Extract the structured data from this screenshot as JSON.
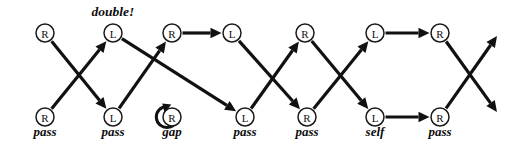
{
  "diagram": {
    "type": "comparison-network",
    "width": 520,
    "height": 142,
    "colors": {
      "stroke": "#111111",
      "node_fill": "#ffffff",
      "node_stroke": "#1a1a1a",
      "text": "#0d0d0d",
      "background": "#ffffff"
    },
    "geometry": {
      "node_radius": 9,
      "top_row_y": 33,
      "bottom_row_y": 117,
      "caption_y": 136,
      "edge_stroke_width": 3.2
    },
    "nodes": [
      {
        "id": "t1",
        "letter": "R",
        "x": 45,
        "y": 33,
        "row": "top",
        "caption": ""
      },
      {
        "id": "t2",
        "letter": "L",
        "x": 113,
        "y": 33,
        "row": "top",
        "caption": ""
      },
      {
        "id": "t3",
        "letter": "R",
        "x": 172,
        "y": 33,
        "row": "top",
        "caption": ""
      },
      {
        "id": "t4",
        "letter": "L",
        "x": 232,
        "y": 33,
        "row": "top",
        "caption": ""
      },
      {
        "id": "t5",
        "letter": "R",
        "x": 305,
        "y": 33,
        "row": "top",
        "caption": ""
      },
      {
        "id": "t6",
        "letter": "L",
        "x": 375,
        "y": 33,
        "row": "top",
        "caption": ""
      },
      {
        "id": "t7",
        "letter": "R",
        "x": 440,
        "y": 33,
        "row": "top",
        "caption": ""
      },
      {
        "id": "b1",
        "letter": "R",
        "x": 45,
        "y": 117,
        "row": "bottom",
        "caption": "pass"
      },
      {
        "id": "b2",
        "letter": "L",
        "x": 113,
        "y": 117,
        "row": "bottom",
        "caption": "pass"
      },
      {
        "id": "b3",
        "letter": "R",
        "x": 172,
        "y": 117,
        "row": "bottom",
        "caption": "gap"
      },
      {
        "id": "b4",
        "letter": "L",
        "x": 245,
        "y": 117,
        "row": "bottom",
        "caption": "pass"
      },
      {
        "id": "b5",
        "letter": "R",
        "x": 307,
        "y": 117,
        "row": "bottom",
        "caption": "pass"
      },
      {
        "id": "b6",
        "letter": "L",
        "x": 375,
        "y": 117,
        "row": "bottom",
        "caption": "self"
      },
      {
        "id": "b7",
        "letter": "R",
        "x": 440,
        "y": 117,
        "row": "bottom",
        "caption": "pass"
      }
    ],
    "annotations": [
      {
        "id": "a1",
        "text": "double!",
        "x": 113,
        "y": 16
      }
    ],
    "edges": [
      {
        "from": "t1",
        "to": "b2",
        "kind": "diagonal-down"
      },
      {
        "from": "b1",
        "to": "t2",
        "kind": "diagonal-up"
      },
      {
        "from": "t2",
        "to": "b4",
        "kind": "diagonal-down-long"
      },
      {
        "from": "b2",
        "to": "t3",
        "kind": "diagonal-up"
      },
      {
        "from": "t3",
        "to": "t4",
        "kind": "horizontal"
      },
      {
        "from": "b3",
        "to": "b3",
        "kind": "self-loop"
      },
      {
        "from": "t4",
        "to": "b5",
        "kind": "diagonal-down"
      },
      {
        "from": "b4",
        "to": "t5",
        "kind": "diagonal-up"
      },
      {
        "from": "t5",
        "to": "b6",
        "kind": "diagonal-down"
      },
      {
        "from": "b5",
        "to": "t6",
        "kind": "diagonal-up"
      },
      {
        "from": "t6",
        "to": "t7",
        "kind": "horizontal"
      },
      {
        "from": "b6",
        "to": "b7",
        "kind": "horizontal"
      },
      {
        "from": "t7",
        "to": "out-low",
        "kind": "diagonal-down-open"
      },
      {
        "from": "b7",
        "to": "out-high",
        "kind": "diagonal-up-open"
      }
    ],
    "open_endpoints": [
      {
        "id": "out-high",
        "x": 497,
        "y": 36
      },
      {
        "id": "out-low",
        "x": 497,
        "y": 112
      }
    ]
  }
}
